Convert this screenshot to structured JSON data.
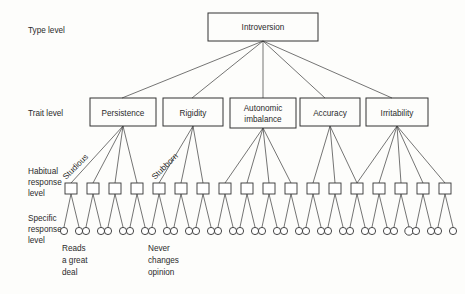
{
  "figure": {
    "background_color": "#fdfdfb",
    "line_color": "#333333",
    "text_color": "#2b2b2b"
  },
  "levels": [
    {
      "id": "type",
      "lines": [
        "Type level"
      ]
    },
    {
      "id": "trait",
      "lines": [
        "Trait level"
      ]
    },
    {
      "id": "habitual",
      "lines": [
        "Habitual",
        "response",
        "level"
      ]
    },
    {
      "id": "specific",
      "lines": [
        "Specific",
        "response",
        "level"
      ]
    }
  ],
  "type_node": {
    "label": "Introversion"
  },
  "trait_nodes": [
    {
      "label": "Persistence",
      "lines": [
        "Persistence"
      ]
    },
    {
      "label": "Rigidity",
      "lines": [
        "Rigidity"
      ]
    },
    {
      "label": "Autonomic imbalance",
      "lines": [
        "Autonomic",
        "imbalance"
      ]
    },
    {
      "label": "Accuracy",
      "lines": [
        "Accuracy"
      ]
    },
    {
      "label": "Irritability",
      "lines": [
        "Irritability"
      ]
    }
  ],
  "habitual_annotations": [
    {
      "label": "Studious"
    },
    {
      "label": "Stubborn"
    }
  ],
  "specific_annotations": [
    {
      "lines": [
        "Reads",
        "a great",
        "deal"
      ]
    },
    {
      "lines": [
        "Never",
        "changes",
        "opinion"
      ]
    }
  ],
  "counts": {
    "trait_nodes": 5,
    "habitual_squares": 18,
    "specific_circles": 36,
    "habitual_per_trait": [
      4,
      3,
      4,
      3,
      4
    ],
    "specific_per_habitual": 2
  }
}
